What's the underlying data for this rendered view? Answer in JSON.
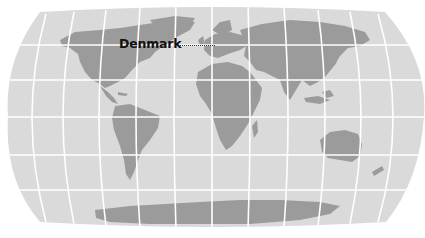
{
  "map": {
    "projection": "robinson-like world map",
    "colors": {
      "ocean": "#dadada",
      "land": "#9b9b9b",
      "graticule": "#ffffff",
      "background": "#ffffff",
      "label": "#111111"
    }
  },
  "annotation": {
    "label": "Denmark",
    "leader_style": "dotted"
  }
}
